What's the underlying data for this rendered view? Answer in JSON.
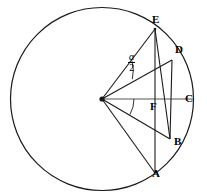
{
  "figure": {
    "type": "geometry-diagram",
    "width": 207,
    "height": 193,
    "stroke_color": "#1a1a1a",
    "background_color": "#ffffff",
    "labels": {
      "A": "A",
      "B": "B",
      "C": "C",
      "D": "D",
      "E": "E",
      "F": "F",
      "angle_numerator": "α",
      "angle_denominator": "2"
    },
    "label_positions": {
      "A": {
        "x": 152,
        "y": 174
      },
      "B": {
        "x": 174,
        "y": 141
      },
      "C": {
        "x": 185,
        "y": 95
      },
      "D": {
        "x": 175,
        "y": 48
      },
      "E": {
        "x": 152,
        "y": 15
      },
      "F": {
        "x": 157,
        "y": 101
      },
      "angle": {
        "x": 130,
        "y": 51
      }
    },
    "circle": {
      "center": {
        "x": 102,
        "y": 99
      },
      "radius": 91.5
    },
    "points": {
      "O": {
        "x": 102,
        "y": 99,
        "label": "",
        "marked": true
      },
      "A": {
        "x": 155,
        "y": 173
      },
      "B": {
        "x": 170,
        "y": 139
      },
      "C": {
        "x": 193,
        "y": 99
      },
      "D": {
        "x": 172,
        "y": 60
      },
      "E": {
        "x": 155,
        "y": 29
      },
      "F": {
        "x": 155,
        "y": 99
      }
    },
    "segments": [
      {
        "name": "OE",
        "from": "O",
        "to": "E"
      },
      {
        "name": "OD",
        "from": "O",
        "to": "D"
      },
      {
        "name": "OC",
        "from": "O",
        "to": "C"
      },
      {
        "name": "OB",
        "from": "O",
        "to": "B"
      },
      {
        "name": "OA",
        "from": "O",
        "to": "A"
      },
      {
        "name": "EA",
        "from": "E",
        "to": "A"
      },
      {
        "name": "EB",
        "from": "E",
        "to": "B"
      },
      {
        "name": "DB",
        "from": "D",
        "to": "B"
      }
    ],
    "angle_arcs": [
      {
        "name": "alpha-half-arc",
        "between": "OE and OD"
      },
      {
        "name": "lower-arc",
        "between": "OC and OB"
      }
    ]
  }
}
